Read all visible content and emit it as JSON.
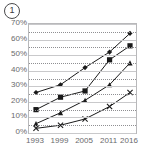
{
  "figure": {
    "label": "1",
    "label_icon": "circled-number-icon"
  },
  "chart_data": {
    "type": "line",
    "title": "",
    "subtitle": "",
    "xlabel": "",
    "ylabel": "",
    "x": [
      "1993",
      "1999",
      "2005",
      "2011",
      "2016"
    ],
    "categories": [
      "1993",
      "1999",
      "2005",
      "2011",
      "2016"
    ],
    "ylim": [
      0,
      70
    ],
    "yticks": [
      0,
      10,
      20,
      30,
      40,
      50,
      60,
      70
    ],
    "ytick_labels": [
      "0%",
      "10%",
      "20%",
      "30%",
      "40%",
      "50%",
      "60%",
      "70%"
    ],
    "xtick_labels": [
      "1993",
      "1999",
      "2005",
      "2011",
      "2016"
    ],
    "grid": true,
    "legend": "none",
    "series": [
      {
        "name": "series-1",
        "marker": "diamond",
        "color": "#1a1a1a",
        "values": [
          26,
          31,
          42,
          52,
          64
        ]
      },
      {
        "name": "series-2",
        "marker": "square",
        "color": "#1a1a1a",
        "values": [
          15,
          23,
          27,
          47,
          56
        ]
      },
      {
        "name": "series-3",
        "marker": "triangle",
        "color": "#1a1a1a",
        "values": [
          6,
          13,
          21,
          31,
          45
        ]
      },
      {
        "name": "series-4",
        "marker": "cross",
        "color": "#1a1a1a",
        "values": [
          3,
          5,
          9,
          17,
          26
        ]
      }
    ]
  },
  "colors": {
    "line": "#1a1a1a",
    "gridline_solid": "#c9c9cb",
    "gridline_dotted": "#8f8f92",
    "frame": "#b8b8ba",
    "tick_text": "#6a6a6c"
  }
}
